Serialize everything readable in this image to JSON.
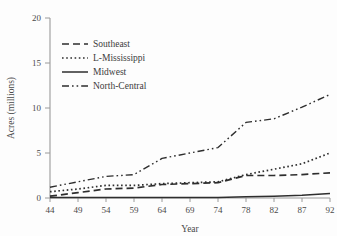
{
  "chart_data": {
    "type": "line",
    "title": "",
    "xlabel": "Year",
    "ylabel": "Acres (millions)",
    "xlim": [
      44,
      92
    ],
    "ylim": [
      0,
      20
    ],
    "grid": false,
    "legend_position": "upper-left",
    "x_tick_labels": [
      "44",
      "49",
      "54",
      "59",
      "64",
      "69",
      "74",
      "78",
      "82",
      "87",
      "92"
    ],
    "x_ticks": [
      44,
      49,
      54,
      59,
      64,
      69,
      74,
      78,
      82,
      87,
      92
    ],
    "y_tick_labels": [
      "0",
      "5",
      "10",
      "15",
      "20"
    ],
    "y_ticks": [
      0,
      5,
      10,
      15,
      20
    ],
    "x": [
      44,
      49,
      54,
      59,
      64,
      69,
      74,
      78,
      82,
      87,
      92
    ],
    "series": [
      {
        "name": "Southeast",
        "dash": "dashed",
        "color": "#2e2e2e",
        "values": [
          0.2,
          0.6,
          1.0,
          1.1,
          1.5,
          1.6,
          1.7,
          2.5,
          2.5,
          2.6,
          2.8
        ]
      },
      {
        "name": "L-Mississippi",
        "dash": "dotted",
        "color": "#2e2e2e",
        "values": [
          0.7,
          1.0,
          1.4,
          1.4,
          1.6,
          1.7,
          1.8,
          2.6,
          3.2,
          3.8,
          5.0
        ]
      },
      {
        "name": "Midwest",
        "dash": "solid",
        "color": "#2e2e2e",
        "values": [
          0.05,
          0.05,
          0.05,
          0.05,
          0.05,
          0.05,
          0.05,
          0.15,
          0.2,
          0.3,
          0.5
        ]
      },
      {
        "name": "North-Central",
        "dash": "dashdotdot",
        "color": "#2e2e2e",
        "values": [
          1.2,
          1.8,
          2.4,
          2.6,
          4.4,
          5.0,
          5.6,
          8.4,
          8.8,
          10.1,
          11.5
        ]
      }
    ]
  },
  "legend": {
    "items": [
      {
        "label": "Southeast"
      },
      {
        "label": "L-Mississippi"
      },
      {
        "label": "Midwest"
      },
      {
        "label": "North-Central"
      }
    ]
  },
  "axes": {
    "y_title": "Acres (millions)",
    "x_title": "Year"
  }
}
